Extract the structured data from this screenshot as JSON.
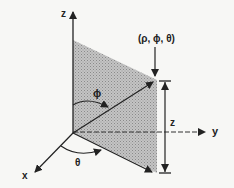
{
  "diagram": {
    "axes": {
      "x": "x",
      "y": "y",
      "z": "z"
    },
    "point_label": "(ρ, ϕ, θ)",
    "angle_phi": "ϕ",
    "angle_theta": "θ",
    "height_label": "z",
    "colors": {
      "ink": "#222222",
      "plane": "#b8b8b8",
      "background": "#f7f7f5"
    }
  }
}
